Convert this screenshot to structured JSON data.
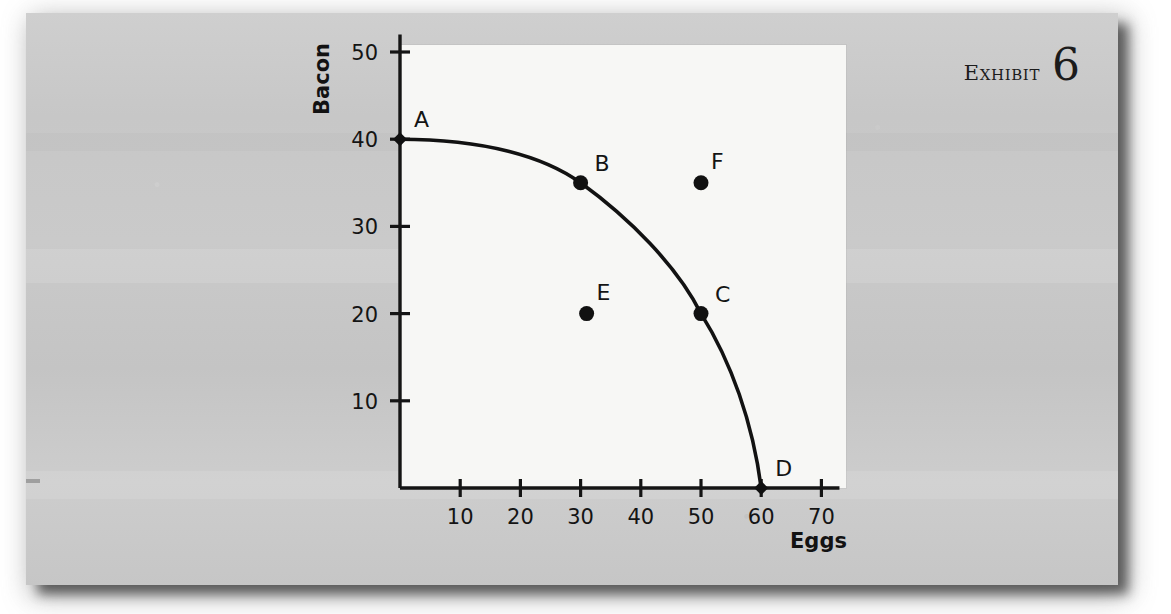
{
  "exhibit": {
    "word": "Exhibit",
    "number": "6"
  },
  "chart_data": {
    "type": "line",
    "title": "",
    "xlabel": "Eggs",
    "ylabel": "Bacon",
    "xlim": [
      0,
      73
    ],
    "ylim": [
      0,
      52
    ],
    "xticks": [
      "10",
      "20",
      "30",
      "40",
      "50",
      "60",
      "70"
    ],
    "xtick_values": [
      10,
      20,
      30,
      40,
      50,
      60,
      70
    ],
    "yticks": [
      "10",
      "20",
      "30",
      "40",
      "50"
    ],
    "ytick_values": [
      10,
      20,
      30,
      40,
      50
    ],
    "grid": false,
    "legend": "none",
    "series": [
      {
        "name": "Production possibilities frontier",
        "on_curve": true,
        "points": [
          {
            "label": "A",
            "x": 0,
            "y": 40,
            "label_dx": 14,
            "label_dy": -12
          },
          {
            "label": "B",
            "x": 30,
            "y": 35,
            "label_dx": 14,
            "label_dy": -12
          },
          {
            "label": "C",
            "x": 50,
            "y": 20,
            "label_dx": 14,
            "label_dy": -12
          },
          {
            "label": "D",
            "x": 60,
            "y": 0,
            "label_dx": 14,
            "label_dy": -12
          }
        ]
      },
      {
        "name": "Off-curve points",
        "on_curve": false,
        "points": [
          {
            "label": "E",
            "x": 31,
            "y": 20,
            "label_dx": 10,
            "label_dy": -14
          },
          {
            "label": "F",
            "x": 50,
            "y": 35,
            "label_dx": 10,
            "label_dy": -14
          }
        ]
      }
    ],
    "curve_description": "Concave production possibilities frontier from (0,40) through (30,35) and (50,20) to (60,0)"
  }
}
